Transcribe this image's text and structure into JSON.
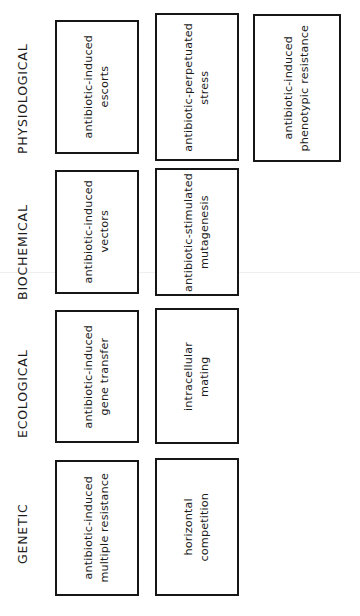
{
  "figure": {
    "orientation": "rotated-90-ccw",
    "background_color": "#ffffff",
    "box_border_color": "#161616",
    "text_color": "#1b1b1b",
    "categories": [
      {
        "id": "physiological",
        "label": "PHYSIOLOGICAL",
        "nodes": [
          {
            "id": "antibiotic-induced-escorts",
            "label": "antibiotic-induced\nescorts"
          },
          {
            "id": "antibiotic-perpetuated-stress",
            "label": "antibiotic-perpetuated\nstress"
          },
          {
            "id": "antibiotic-induced-phenotypic-resistance",
            "label": "antibiotic-induced\nphenotypic resistance"
          }
        ]
      },
      {
        "id": "biochemical",
        "label": "BIOCHEMICAL",
        "nodes": [
          {
            "id": "antibiotic-induced-vectors",
            "label": "antibiotic-induced\nvectors"
          },
          {
            "id": "antibiotic-stimulated-mutagenesis",
            "label": "antibiotic-stimulated\nmutagenesis"
          }
        ]
      },
      {
        "id": "ecological",
        "label": "ECOLOGICAL",
        "nodes": [
          {
            "id": "antibiotic-induced-gene-transfer",
            "label": "antibiotic-induced\ngene transfer"
          },
          {
            "id": "intracellular-mating",
            "label": "intracellular\nmating"
          }
        ]
      },
      {
        "id": "genetic",
        "label": "GENETIC",
        "nodes": [
          {
            "id": "antibiotic-induced-multiple-resistance",
            "label": "antibiotic-induced\nmultiple resistance"
          },
          {
            "id": "horizontal-competition",
            "label": "horizontal\ncompetition"
          }
        ]
      }
    ]
  }
}
